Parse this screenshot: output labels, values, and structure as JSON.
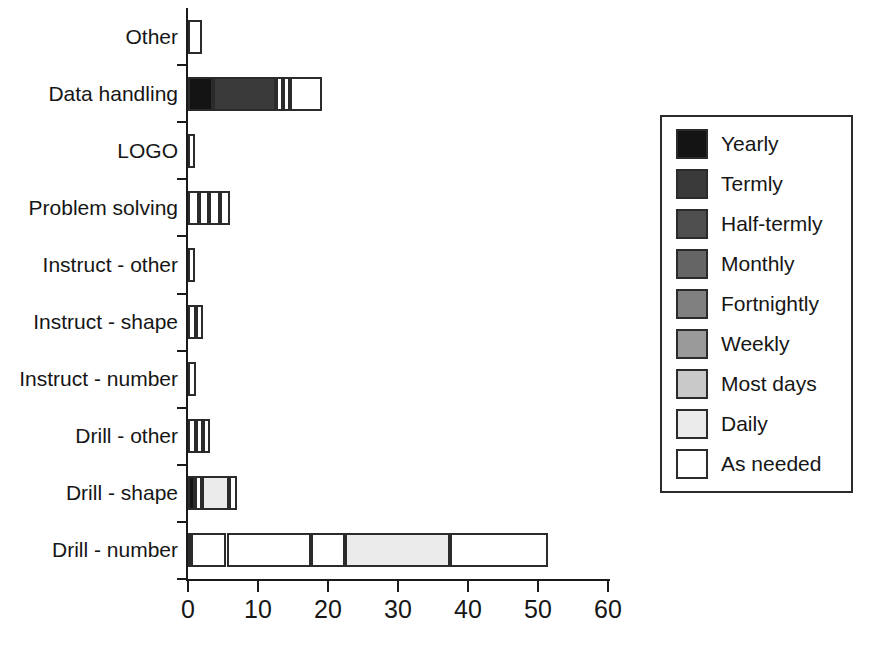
{
  "chart_data": {
    "type": "bar",
    "orientation": "horizontal",
    "stacked": true,
    "title": "",
    "subtitle": "",
    "xlabel": "",
    "ylabel": "",
    "xlim": [
      0,
      60
    ],
    "ylim": null,
    "grid": false,
    "legend_position": "right",
    "xticks": [
      0,
      10,
      20,
      30,
      40,
      50,
      60
    ],
    "xtick_labels": [
      "0",
      "10",
      "20",
      "30",
      "40",
      "50",
      "60"
    ],
    "categories": [
      "Other",
      "Data handling",
      "LOGO",
      "Problem solving",
      "Instruct - other",
      "Instruct - shape",
      "Instruct - number",
      "Drill - other",
      "Drill - shape",
      "Drill - number"
    ],
    "series": [
      {
        "name": "Yearly",
        "color": "#141414",
        "values": [
          0,
          3.5,
          0,
          0,
          0,
          0,
          0,
          0,
          1.0,
          0
        ]
      },
      {
        "name": "Termly",
        "color": "#3a3a3a",
        "values": [
          0,
          9.0,
          0,
          0,
          0,
          0,
          0,
          0,
          0,
          0
        ]
      },
      {
        "name": "Half-termly",
        "color": "#4f4f4f",
        "values": [
          0,
          0,
          0,
          0,
          0,
          0,
          0,
          0,
          0,
          0
        ]
      },
      {
        "name": "Monthly",
        "color": "#656565",
        "values": [
          0,
          0,
          0,
          0,
          0,
          0,
          0,
          0,
          0,
          0.3
        ]
      },
      {
        "name": "Fortnightly",
        "color": "#808080",
        "values": [
          0,
          0,
          0,
          0,
          0,
          0,
          0,
          0,
          0,
          0
        ]
      },
      {
        "name": "Weekly",
        "color": "#9a9a9a",
        "values": [
          0,
          0,
          0,
          0,
          0,
          0,
          0,
          0,
          0,
          0
        ]
      },
      {
        "name": "Most days",
        "color": "#c9c9c9",
        "values": [
          0,
          0,
          0,
          0,
          0,
          0,
          0,
          0,
          0,
          0
        ]
      },
      {
        "name": "Daily",
        "color": "#ebebeb",
        "values": [
          0,
          0,
          0,
          0,
          0,
          0,
          0,
          0,
          4.0,
          15.0
        ]
      },
      {
        "name": "As needed",
        "color": "#ffffff",
        "values": [
          2.0,
          0,
          1.0,
          0,
          1.0,
          0,
          1.0,
          0,
          0,
          0
        ]
      }
    ],
    "bars": [
      {
        "category": "Other",
        "total": 2.0,
        "segments": [
          {
            "series": "As needed",
            "start": 0,
            "end": 2.0,
            "color": "#ffffff"
          }
        ]
      },
      {
        "category": "Data handling",
        "total": 19.2,
        "segments": [
          {
            "series": "Yearly",
            "start": 0,
            "end": 3.5,
            "color": "#141414"
          },
          {
            "series": "Termly",
            "start": 3.5,
            "end": 12.5,
            "color": "#3a3a3a"
          },
          {
            "series": "Daily",
            "start": 12.5,
            "end": 13.6,
            "color": "#ffffff"
          },
          {
            "series": "As needed",
            "start": 13.6,
            "end": 14.6,
            "color": "#ffffff"
          },
          {
            "series": "As needed",
            "start": 14.6,
            "end": 19.2,
            "color": "#ffffff"
          }
        ]
      },
      {
        "category": "LOGO",
        "total": 1.0,
        "segments": [
          {
            "series": "As needed",
            "start": 0,
            "end": 1.0,
            "color": "#ffffff"
          }
        ]
      },
      {
        "category": "Problem solving",
        "total": 6.0,
        "segments": [
          {
            "series": "Weekly",
            "start": 0,
            "end": 1.6,
            "color": "#ffffff"
          },
          {
            "series": "Most days",
            "start": 1.6,
            "end": 3.0,
            "color": "#ffffff"
          },
          {
            "series": "Daily",
            "start": 3.0,
            "end": 4.5,
            "color": "#ffffff"
          },
          {
            "series": "As needed",
            "start": 4.5,
            "end": 6.0,
            "color": "#ffffff"
          }
        ]
      },
      {
        "category": "Instruct - other",
        "total": 1.0,
        "segments": [
          {
            "series": "As needed",
            "start": 0,
            "end": 1.0,
            "color": "#ffffff"
          }
        ]
      },
      {
        "category": "Instruct - shape",
        "total": 2.2,
        "segments": [
          {
            "series": "Daily",
            "start": 0,
            "end": 1.1,
            "color": "#ffffff"
          },
          {
            "series": "As needed",
            "start": 1.1,
            "end": 2.2,
            "color": "#ffffff"
          }
        ]
      },
      {
        "category": "Instruct - number",
        "total": 1.1,
        "segments": [
          {
            "series": "As needed",
            "start": 0,
            "end": 1.1,
            "color": "#ffffff"
          }
        ]
      },
      {
        "category": "Drill - other",
        "total": 3.2,
        "segments": [
          {
            "series": "Weekly",
            "start": 0,
            "end": 1.1,
            "color": "#ffffff"
          },
          {
            "series": "Daily",
            "start": 1.1,
            "end": 2.2,
            "color": "#ffffff"
          },
          {
            "series": "As needed",
            "start": 2.2,
            "end": 3.2,
            "color": "#ffffff"
          }
        ]
      },
      {
        "category": "Drill - shape",
        "total": 7.0,
        "segments": [
          {
            "series": "Yearly",
            "start": 0,
            "end": 1.0,
            "color": "#141414"
          },
          {
            "series": "Weekly",
            "start": 1.0,
            "end": 2.0,
            "color": "#ffffff"
          },
          {
            "series": "Most days",
            "start": 2.0,
            "end": 5.9,
            "color": "#ebebeb"
          },
          {
            "series": "As needed",
            "start": 5.9,
            "end": 7.0,
            "color": "#ffffff"
          }
        ]
      },
      {
        "category": "Drill - number",
        "total": 51.5,
        "segments": [
          {
            "series": "Monthly",
            "start": 0,
            "end": 0.4,
            "color": "#ffffff"
          },
          {
            "series": "Weekly",
            "start": 0.4,
            "end": 5.5,
            "color": "#ffffff"
          },
          {
            "series": "Most days",
            "start": 5.5,
            "end": 17.5,
            "color": "#ffffff"
          },
          {
            "series": "Daily",
            "start": 17.5,
            "end": 22.4,
            "color": "#ffffff"
          },
          {
            "series": "Daily",
            "start": 22.4,
            "end": 37.4,
            "color": "#ebebeb"
          },
          {
            "series": "As needed",
            "start": 37.4,
            "end": 51.5,
            "color": "#ffffff"
          }
        ]
      }
    ],
    "legend": [
      {
        "label": "Yearly",
        "color": "#141414"
      },
      {
        "label": "Termly",
        "color": "#3a3a3a"
      },
      {
        "label": "Half-termly",
        "color": "#4f4f4f"
      },
      {
        "label": "Monthly",
        "color": "#656565"
      },
      {
        "label": "Fortnightly",
        "color": "#808080"
      },
      {
        "label": "Weekly",
        "color": "#9a9a9a"
      },
      {
        "label": "Most days",
        "color": "#c9c9c9"
      },
      {
        "label": "Daily",
        "color": "#ebebeb"
      },
      {
        "label": "As needed",
        "color": "#ffffff"
      }
    ],
    "axis_color": "#1a1a1a",
    "outline_color": "#2b2b2b",
    "background": "#ffffff"
  }
}
